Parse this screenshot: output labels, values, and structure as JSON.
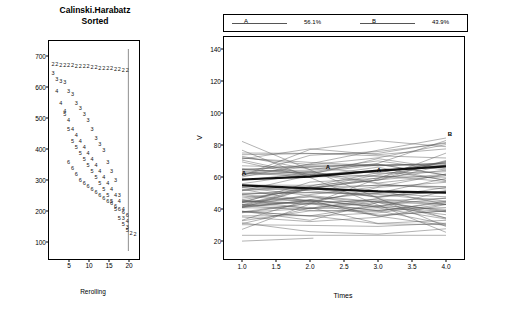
{
  "left": {
    "title_line1": "Calinski.Harabatz",
    "title_line2": "Sorted",
    "xlabel": "Rerolling",
    "y_ticks": [
      "100",
      "200",
      "300",
      "400",
      "500",
      "600",
      "700"
    ],
    "x_ticks": [
      "5",
      "10",
      "15",
      "20"
    ]
  },
  "right": {
    "ylabel": "V",
    "xlabel": "Times",
    "y_ticks": [
      "20",
      "40",
      "60",
      "80",
      "100",
      "120",
      "140"
    ],
    "x_ticks": [
      "1.0",
      "1.5",
      "2.0",
      "2.5",
      "3.0",
      "3.5",
      "4.0"
    ],
    "legend": [
      {
        "symbol": "A",
        "label": "56.1%"
      },
      {
        "symbol": "B",
        "label": "43.9%"
      }
    ],
    "cluster_labels": [
      "A",
      "A",
      "A",
      "B"
    ]
  },
  "chart_data": [
    {
      "type": "scatter",
      "title": "Calinski.Harabatz Sorted",
      "xlabel": "Rerolling",
      "ylabel": "",
      "xlim": [
        1,
        22
      ],
      "ylim": [
        80,
        720
      ],
      "grid": false,
      "note": "Each point is plotted as a digit glyph denoting the number of clusters (2-6). Several descending sequences, one per cluster count.",
      "series": [
        {
          "name": "2",
          "x": [
            1,
            2,
            3,
            4,
            5,
            6,
            7,
            8,
            9,
            10,
            11,
            12,
            13,
            14,
            15,
            16,
            17,
            18,
            19,
            20,
            21,
            22
          ],
          "y": [
            690,
            690,
            688,
            688,
            686,
            686,
            684,
            684,
            682,
            682,
            680,
            680,
            678,
            678,
            676,
            676,
            674,
            672,
            670,
            668,
            120,
            118
          ]
        },
        {
          "name": "3",
          "x": [
            1,
            2,
            3,
            4,
            5,
            6,
            7,
            8,
            9,
            10,
            11,
            12,
            13,
            14,
            15,
            16,
            17,
            18,
            19,
            20
          ],
          "y": [
            660,
            640,
            632,
            628,
            600,
            590,
            560,
            540,
            520,
            500,
            470,
            440,
            420,
            400,
            360,
            330,
            300,
            250,
            170,
            140
          ]
        },
        {
          "name": "4",
          "x": [
            2,
            3,
            4,
            5,
            6,
            7,
            8,
            9,
            10,
            11,
            12,
            13,
            14,
            15,
            16,
            17,
            18,
            19,
            20
          ],
          "y": [
            600,
            560,
            530,
            500,
            470,
            450,
            430,
            410,
            390,
            370,
            350,
            330,
            310,
            290,
            270,
            250,
            230,
            200,
            160
          ]
        },
        {
          "name": "5",
          "x": [
            4,
            5,
            6,
            7,
            8,
            9,
            10,
            11,
            12,
            13,
            14,
            15,
            16,
            17,
            18,
            19,
            20
          ],
          "y": [
            520,
            470,
            430,
            410,
            390,
            370,
            350,
            330,
            310,
            290,
            270,
            250,
            230,
            200,
            170,
            150,
            130
          ]
        },
        {
          "name": "6",
          "x": [
            5,
            6,
            7,
            8,
            9,
            10,
            11,
            12,
            13,
            14,
            15,
            16,
            17,
            18,
            19,
            20
          ],
          "y": [
            360,
            340,
            320,
            300,
            290,
            280,
            270,
            260,
            250,
            240,
            230,
            220,
            210,
            200,
            190,
            180
          ]
        }
      ]
    },
    {
      "type": "line",
      "title": "",
      "xlabel": "Times",
      "ylabel": "V",
      "xlim": [
        1.0,
        4.0
      ],
      "ylim": [
        10,
        145
      ],
      "grid": false,
      "legend_position": "top",
      "legend": [
        "A  56.1%",
        "B  43.9%"
      ],
      "cluster_means": {
        "A": {
          "x": [
            1.0,
            2.0,
            3.0,
            4.0
          ],
          "y": [
            52,
            50,
            48,
            47
          ]
        },
        "B": {
          "x": [
            1.0,
            2.0,
            3.0,
            4.0
          ],
          "y": [
            56,
            58,
            62,
            65
          ]
        }
      },
      "note": "Parallel-coordinate style plot of ~70 individual trajectories over 4 time points, mostly clustered between 20 and 80, with cluster mean lines labelled A and B."
    }
  ]
}
